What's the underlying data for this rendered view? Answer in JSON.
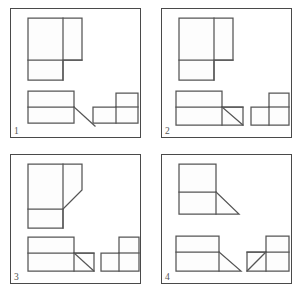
{
  "figure": {
    "panel_count": 4,
    "stroke_color": "#555555",
    "frame_color": "#4a4a4a",
    "background_color": "#ffffff",
    "page_width": 302,
    "page_height": 292
  },
  "panels": [
    {
      "id": "panel-1",
      "number": "1",
      "position": "top-left",
      "shapes": {
        "top_view": {
          "name": "top-view-shape-1",
          "description": "L-shaped outline: large square with a notch at lower right; vertical divider and horizontal divider lines",
          "has_diagonal": false
        },
        "bottom_left_view": {
          "name": "front-view-shape-1",
          "description": "Rectangle split horizontally, with a diagonal running from the mid-line down-right to a point outside the rectangle",
          "has_diagonal": true,
          "diagonal_direction": "down-right-exterior"
        },
        "bottom_right_view": {
          "name": "side-view-shape-1",
          "description": "Two stepped rectangles: upper-right rectangle sitting on a wider lower rectangle",
          "has_diagonal": false
        }
      }
    },
    {
      "id": "panel-2",
      "number": "2",
      "position": "top-right",
      "shapes": {
        "top_view": {
          "name": "top-view-shape-2",
          "description": "L-shaped outline: large square with a notch at lower right; vertical divider and horizontal divider lines",
          "has_diagonal": false
        },
        "bottom_left_view": {
          "name": "front-view-shape-2",
          "description": "Rectangle split horizontally with an attached small square to the lower right containing an internal diagonal",
          "has_diagonal": true,
          "diagonal_direction": "down-right-interior"
        },
        "bottom_right_view": {
          "name": "side-view-shape-2",
          "description": "Two stepped rectangles: upper-right rectangle sitting on a wider lower rectangle",
          "has_diagonal": false
        }
      }
    },
    {
      "id": "panel-3",
      "number": "3",
      "position": "bottom-left",
      "shapes": {
        "top_view": {
          "name": "top-view-shape-3",
          "description": "Square with a chamfered (diagonally cut) upper-right corner region and a horizontal divider; lower left block projects down",
          "has_diagonal": true,
          "diagonal_direction": "chamfer-down-left"
        },
        "bottom_left_view": {
          "name": "front-view-shape-3",
          "description": "Rectangle split horizontally with a small square at lower right crossed by a diagonal from the upper-left corner",
          "has_diagonal": true,
          "diagonal_direction": "down-right-interior"
        },
        "bottom_right_view": {
          "name": "side-view-shape-3",
          "description": "Two stepped rectangles: upper-right rectangle sitting on a wider lower rectangle",
          "has_diagonal": false
        }
      }
    },
    {
      "id": "panel-4",
      "number": "4",
      "position": "bottom-right",
      "shapes": {
        "top_view": {
          "name": "top-view-shape-4",
          "description": "Square split horizontally with a right-triangle wedge extending to the right from the mid-line",
          "has_diagonal": true,
          "diagonal_direction": "down-right-exterior"
        },
        "bottom_left_view": {
          "name": "front-view-shape-4",
          "description": "Rectangle split horizontally, with a diagonal running from the mid-line down-right to a point outside the rectangle",
          "has_diagonal": true,
          "diagonal_direction": "down-right-exterior"
        },
        "bottom_right_view": {
          "name": "side-view-shape-4",
          "description": "Stepped rectangles with a small triangle notch at the lower left formed by a diagonal rising to the right",
          "has_diagonal": true,
          "diagonal_direction": "up-right-interior"
        }
      }
    }
  ]
}
